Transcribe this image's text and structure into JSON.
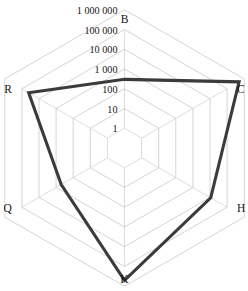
{
  "chart_data": {
    "type": "radar",
    "title": "",
    "subtitle": "",
    "xlabel": "",
    "ylabel": "",
    "scale": "log10",
    "grid": true,
    "legend": "none",
    "categories": [
      "B",
      "C",
      "H",
      "K",
      "Q",
      "R"
    ],
    "tick_labels": [
      "1",
      "10",
      "100",
      "1 000",
      "10 000",
      "100 000",
      "1 000 000"
    ],
    "tick_values": [
      1,
      10,
      100,
      1000,
      10000,
      100000,
      1000000
    ],
    "rlim": [
      1,
      1000000
    ],
    "series": [
      {
        "name": "series-1",
        "color": "#3b3b3b",
        "values": [
          300,
          500000,
          11000,
          500000,
          500,
          40000
        ]
      }
    ],
    "colors": {
      "data_line": "#3b3b3b",
      "grid": "#c9c9c9",
      "text": "#141414",
      "background": "#ffffff"
    }
  },
  "axes": {
    "vertices": [
      {
        "key": "B",
        "label": "B",
        "angle_deg": 90
      },
      {
        "key": "C",
        "label": "C",
        "angle_deg": 30
      },
      {
        "key": "H",
        "label": "H",
        "angle_deg": -30
      },
      {
        "key": "K",
        "label": "K",
        "angle_deg": -90
      },
      {
        "key": "Q",
        "label": "Q",
        "angle_deg": -150
      },
      {
        "key": "R",
        "label": "R",
        "angle_deg": 150
      }
    ]
  },
  "ticks": {
    "items": [
      {
        "label": "1 000 000",
        "value": 1000000
      },
      {
        "label": "100 000",
        "value": 100000
      },
      {
        "label": "10 000",
        "value": 10000
      },
      {
        "label": "1 000",
        "value": 1000
      },
      {
        "label": "100",
        "value": 100
      },
      {
        "label": "10",
        "value": 10
      },
      {
        "label": "1",
        "value": 1
      }
    ]
  }
}
